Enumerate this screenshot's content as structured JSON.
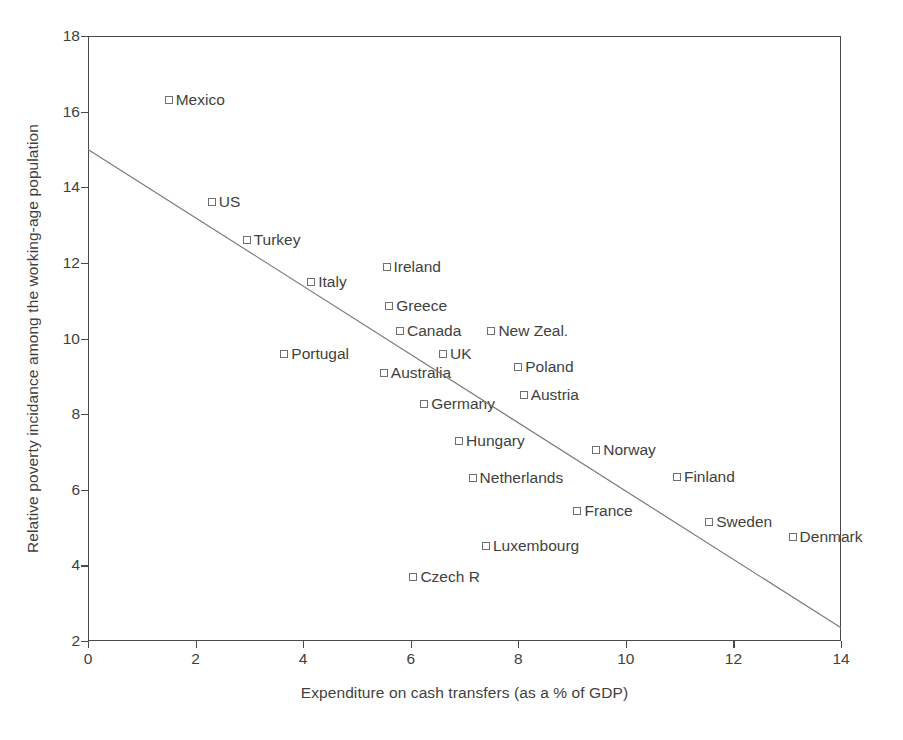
{
  "chart_data": {
    "type": "scatter",
    "title": "",
    "xlabel": "Expenditure on cash transfers (as a % of GDP)",
    "ylabel": "Relative poverty incidance among the working-age population",
    "xlim": [
      0,
      14
    ],
    "ylim": [
      2,
      18
    ],
    "xticks": [
      0,
      2,
      4,
      6,
      8,
      10,
      12,
      14
    ],
    "yticks": [
      2,
      4,
      6,
      8,
      10,
      12,
      14,
      16,
      18
    ],
    "grid": false,
    "legend": "none",
    "marker": "open-square",
    "points": [
      {
        "label": "Mexico",
        "x": 1.5,
        "y": 16.3,
        "label_side": "right"
      },
      {
        "label": "US",
        "x": 2.3,
        "y": 13.6,
        "label_side": "right"
      },
      {
        "label": "Turkey",
        "x": 2.95,
        "y": 12.6,
        "label_side": "right"
      },
      {
        "label": "Italy",
        "x": 4.15,
        "y": 11.5,
        "label_side": "right"
      },
      {
        "label": "Ireland",
        "x": 5.55,
        "y": 11.9,
        "label_side": "right"
      },
      {
        "label": "Greece",
        "x": 5.6,
        "y": 10.85,
        "label_side": "right"
      },
      {
        "label": "Canada",
        "x": 5.8,
        "y": 10.2,
        "label_side": "right"
      },
      {
        "label": "New Zeal.",
        "x": 7.5,
        "y": 10.2,
        "label_side": "right"
      },
      {
        "label": "Portugal",
        "x": 3.65,
        "y": 9.6,
        "label_side": "right"
      },
      {
        "label": "UK",
        "x": 6.6,
        "y": 9.6,
        "label_side": "right"
      },
      {
        "label": "Poland",
        "x": 8.0,
        "y": 9.25,
        "label_side": "right"
      },
      {
        "label": "Australia",
        "x": 5.5,
        "y": 9.1,
        "label_side": "right"
      },
      {
        "label": "Austria",
        "x": 8.1,
        "y": 8.5,
        "label_side": "right"
      },
      {
        "label": "Germany",
        "x": 6.25,
        "y": 8.27,
        "label_side": "right"
      },
      {
        "label": "Hungary",
        "x": 6.9,
        "y": 7.3,
        "label_side": "right"
      },
      {
        "label": "Norway",
        "x": 9.45,
        "y": 7.05,
        "label_side": "right"
      },
      {
        "label": "Finland",
        "x": 10.95,
        "y": 6.35,
        "label_side": "right"
      },
      {
        "label": "Netherlands",
        "x": 7.15,
        "y": 6.3,
        "label_side": "right"
      },
      {
        "label": "France",
        "x": 9.1,
        "y": 5.45,
        "label_side": "right"
      },
      {
        "label": "Sweden",
        "x": 11.55,
        "y": 5.15,
        "label_side": "right"
      },
      {
        "label": "Denmark",
        "x": 13.1,
        "y": 4.75,
        "label_side": "right"
      },
      {
        "label": "Luxembourg",
        "x": 7.4,
        "y": 4.5,
        "label_side": "right"
      },
      {
        "label": "Czech R",
        "x": 6.05,
        "y": 3.7,
        "label_side": "right"
      }
    ],
    "trendline": {
      "type": "line",
      "x_start": 0,
      "y_start": 15.0,
      "x_end": 14,
      "y_end": 2.35,
      "color": "#7a7a7a"
    },
    "colors": {
      "axis": "#4a4a4a",
      "text": "#3f3f3f",
      "marker_stroke": "#6f6f6f",
      "marker_fill": "#ffffff",
      "trend": "#7a7a7a",
      "background": "#ffffff"
    }
  }
}
